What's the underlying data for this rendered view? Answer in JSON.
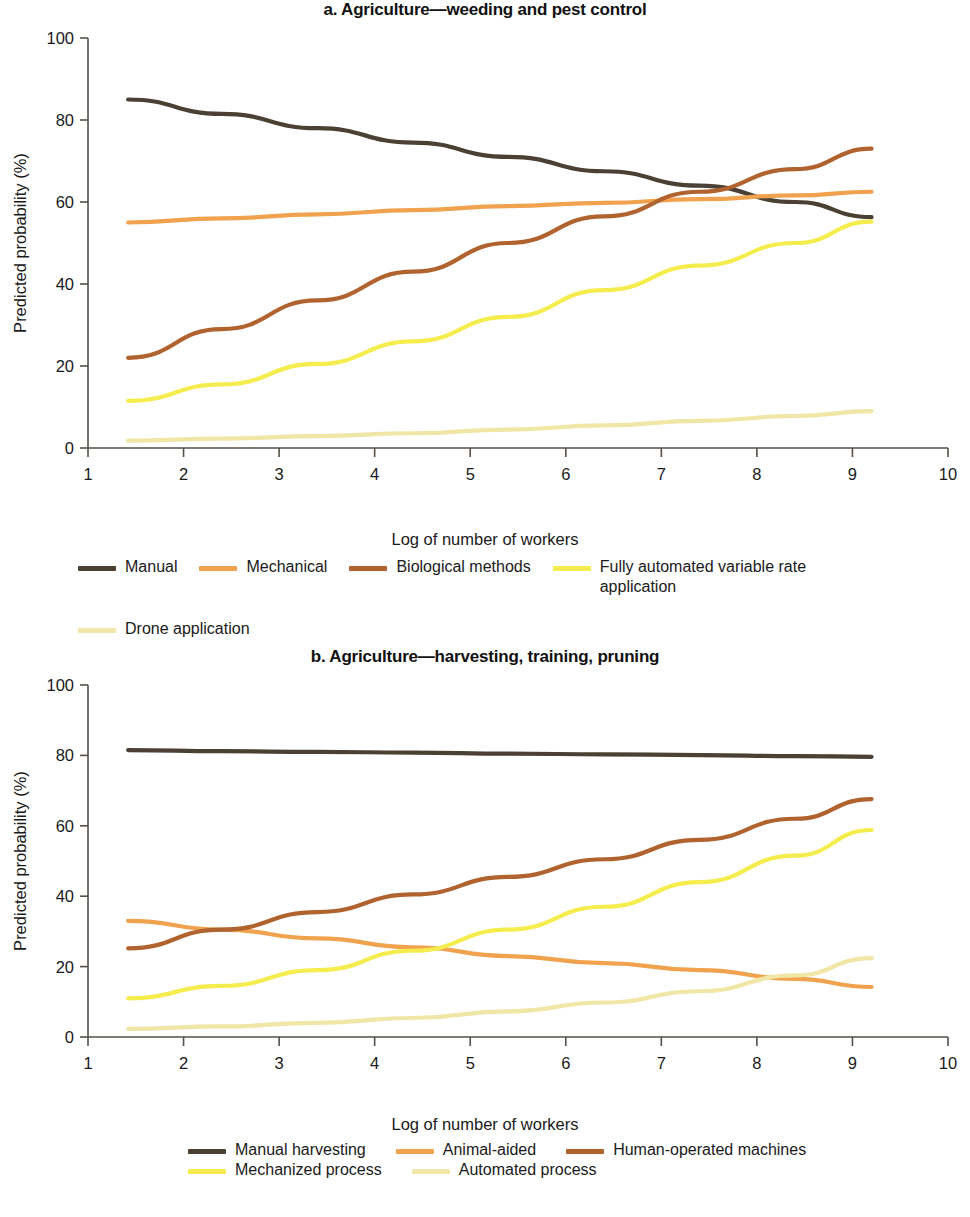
{
  "figure": {
    "y_axis_title": "Predicted probability (%)",
    "x_axis_title": "Log of number of workers"
  },
  "panel_a": {
    "title": "a. Agriculture—weeding and pest control",
    "legend": [
      {
        "label": "Manual",
        "color": "#4a4034"
      },
      {
        "label": "Mechanical",
        "color": "#f0a24e"
      },
      {
        "label": "Biological methods",
        "color": "#b1632f"
      },
      {
        "label": "Fully automated variable rate application",
        "color": "#f5ed4e"
      },
      {
        "label": "Drone application",
        "color": "#f0e6a6"
      }
    ]
  },
  "panel_b": {
    "title": "b. Agriculture—harvesting, training, pruning",
    "legend": [
      {
        "label": "Manual harvesting",
        "color": "#4a4034"
      },
      {
        "label": "Animal-aided",
        "color": "#f0a24e"
      },
      {
        "label": "Human-operated machines",
        "color": "#b1632f"
      },
      {
        "label": "Mechanized process",
        "color": "#f5ed4e"
      },
      {
        "label": "Automated process",
        "color": "#f0e6a6"
      }
    ]
  },
  "chart_data": [
    {
      "type": "line",
      "title": "a. Agriculture—weeding and pest control",
      "xlabel": "Log of number of workers",
      "ylabel": "Predicted probability (%)",
      "xlim": [
        1,
        10
      ],
      "ylim": [
        0,
        100
      ],
      "xticks": [
        1,
        2,
        3,
        4,
        5,
        6,
        7,
        8,
        9,
        10
      ],
      "yticks": [
        0,
        20,
        40,
        60,
        80,
        100
      ],
      "grid": false,
      "legend_position": "bottom",
      "x": [
        1.42,
        2.4,
        3.4,
        4.4,
        5.4,
        6.4,
        7.4,
        8.4,
        9.2
      ],
      "series": [
        {
          "name": "Manual",
          "color": "#4a4034",
          "values": [
            85.0,
            81.5,
            78.0,
            74.5,
            71.0,
            67.5,
            64.0,
            60.0,
            56.3
          ]
        },
        {
          "name": "Mechanical",
          "color": "#f0a24e",
          "values": [
            55.0,
            56.0,
            57.0,
            58.0,
            59.0,
            59.8,
            60.7,
            61.6,
            62.5
          ]
        },
        {
          "name": "Biological methods",
          "color": "#b1632f",
          "values": [
            22.0,
            29.0,
            36.0,
            43.0,
            50.0,
            56.5,
            62.5,
            68.0,
            73.0
          ]
        },
        {
          "name": "Fully automated variable rate application",
          "color": "#f5ed4e",
          "values": [
            11.5,
            15.5,
            20.5,
            26.0,
            32.0,
            38.5,
            44.5,
            50.0,
            55.2
          ]
        },
        {
          "name": "Drone application",
          "color": "#f0e6a6",
          "values": [
            1.8,
            2.3,
            2.9,
            3.6,
            4.5,
            5.5,
            6.6,
            7.8,
            9.0
          ]
        }
      ]
    },
    {
      "type": "line",
      "title": "b. Agriculture—harvesting, training, pruning",
      "xlabel": "Log of number of workers",
      "ylabel": "Predicted probability (%)",
      "xlim": [
        1,
        10
      ],
      "ylim": [
        0,
        100
      ],
      "xticks": [
        1,
        2,
        3,
        4,
        5,
        6,
        7,
        8,
        9,
        10
      ],
      "yticks": [
        0,
        20,
        40,
        60,
        80,
        100
      ],
      "grid": false,
      "legend_position": "bottom",
      "x": [
        1.42,
        2.4,
        3.4,
        4.4,
        5.4,
        6.4,
        7.4,
        8.4,
        9.2
      ],
      "series": [
        {
          "name": "Manual harvesting",
          "color": "#4a4034",
          "values": [
            81.5,
            81.2,
            81.0,
            80.8,
            80.5,
            80.3,
            80.1,
            79.8,
            79.6
          ]
        },
        {
          "name": "Animal-aided",
          "color": "#f0a24e",
          "values": [
            33.0,
            30.5,
            28.0,
            25.5,
            23.0,
            21.0,
            19.0,
            16.5,
            14.2
          ]
        },
        {
          "name": "Human-operated machines",
          "color": "#b1632f",
          "values": [
            25.2,
            30.5,
            35.5,
            40.5,
            45.5,
            50.5,
            56.0,
            62.0,
            67.6
          ]
        },
        {
          "name": "Mechanized process",
          "color": "#f5ed4e",
          "values": [
            11.0,
            14.5,
            19.0,
            24.5,
            30.5,
            37.0,
            44.0,
            51.5,
            58.8
          ]
        },
        {
          "name": "Automated process",
          "color": "#f0e6a6",
          "values": [
            2.3,
            3.0,
            4.0,
            5.4,
            7.3,
            9.8,
            13.0,
            17.5,
            22.4
          ]
        }
      ]
    }
  ]
}
